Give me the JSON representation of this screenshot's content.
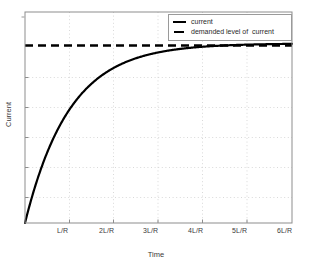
{
  "chart_data": {
    "type": "line",
    "title": "",
    "xlabel": "Time",
    "ylabel": "Current",
    "xlim": [
      0,
      6
    ],
    "ylim": [
      0,
      1.175
    ],
    "grid": true,
    "grid_style": "dotted",
    "legend_position": "top-right",
    "x_tick_labels": [
      "L/R",
      "2L/R",
      "3L/R",
      "4L/R",
      "5L/R",
      "6L/R"
    ],
    "x_tick_values": [
      1,
      2,
      3,
      4,
      5,
      6
    ],
    "y_tick_labels": [
      "",
      "",
      "",
      "",
      "",
      ""
    ],
    "y_gridline_values": [
      0.167,
      0.333,
      0.5,
      0.667,
      0.833
    ],
    "series": [
      {
        "name": "current",
        "style": "solid",
        "color": "#000000",
        "linewidth": 2.2,
        "equation": "i(t) = Imax * (1 - exp(-t / (L/R)))",
        "x": [
          0,
          0.1,
          0.2,
          0.3,
          0.4,
          0.5,
          0.6,
          0.7,
          0.8,
          0.9,
          1.0,
          1.2,
          1.4,
          1.6,
          1.8,
          2.0,
          2.25,
          2.5,
          2.75,
          3.0,
          3.5,
          4.0,
          4.5,
          5.0,
          5.5,
          6.0
        ],
        "values": [
          0,
          0.0952,
          0.1813,
          0.2592,
          0.3297,
          0.3935,
          0.4512,
          0.5034,
          0.5507,
          0.5934,
          0.6321,
          0.6988,
          0.7534,
          0.7981,
          0.8347,
          0.8647,
          0.8946,
          0.9179,
          0.9361,
          0.9502,
          0.9698,
          0.9817,
          0.9889,
          0.9933,
          0.9959,
          0.9975
        ]
      },
      {
        "name": "demanded level of  current",
        "style": "dashed",
        "color": "#000000",
        "linewidth": 2.2,
        "constant_value": 1.0,
        "x": [
          0,
          6
        ],
        "values": [
          1.0,
          1.0
        ]
      }
    ],
    "legend_entries": [
      {
        "label": "current",
        "style": "solid"
      },
      {
        "label": "demanded level of  current",
        "style": "dashed"
      }
    ]
  },
  "axes": {
    "x_title": "Time",
    "y_title": "Current",
    "ticks": {
      "x": [
        {
          "label": "L/R"
        },
        {
          "label": "2L/R"
        },
        {
          "label": "3L/R"
        },
        {
          "label": "4L/R"
        },
        {
          "label": "5L/R"
        },
        {
          "label": "6L/R"
        }
      ]
    }
  },
  "legend": {
    "entries": [
      {
        "label": "current"
      },
      {
        "label": "demanded level of  current"
      }
    ]
  },
  "colors": {
    "curve": "#000000",
    "asymptote": "#000000",
    "axis": "#6e6e6e",
    "grid": "#c9c9c9",
    "text": "#3a3a3a",
    "background": "#ffffff"
  }
}
